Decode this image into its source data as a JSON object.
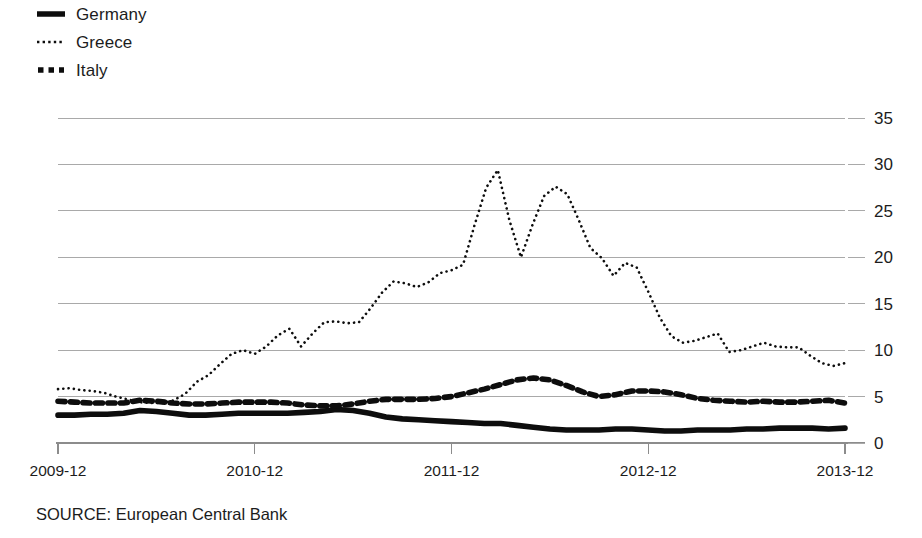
{
  "legend": {
    "position": "top-left",
    "entries": [
      {
        "label": "Germany",
        "style": "solid-thick",
        "icon": "solid-line-icon"
      },
      {
        "label": "Greece",
        "style": "fine-dotted",
        "icon": "dotted-line-icon"
      },
      {
        "label": "Italy",
        "style": "square-dashed",
        "icon": "dashed-line-icon"
      }
    ]
  },
  "footer": {
    "source": "SOURCE: European Central Bank"
  },
  "chart_data": {
    "type": "line",
    "title": "",
    "subtitle": "",
    "xlabel": "",
    "ylabel": "",
    "grid": true,
    "legend_position": "top-left",
    "y_axis_side": "right",
    "ylim": [
      0,
      35
    ],
    "yticks": [
      0,
      5,
      10,
      15,
      20,
      25,
      30,
      35
    ],
    "ytick_labels": [
      "0",
      "5",
      "10",
      "15",
      "20",
      "25",
      "30",
      "35"
    ],
    "xtick_labels": [
      "2009-12",
      "2010-12",
      "2011-12",
      "2012-12",
      "2013-12"
    ],
    "xtick_index": [
      0,
      12,
      24,
      36,
      48
    ],
    "x": [
      "2009-12",
      "2010-01",
      "2010-02",
      "2010-03",
      "2010-04",
      "2010-05",
      "2010-06",
      "2010-07",
      "2010-08",
      "2010-09",
      "2010-10",
      "2010-11",
      "2010-12",
      "2011-01",
      "2011-02",
      "2011-03",
      "2011-04",
      "2011-05",
      "2011-06",
      "2011-07",
      "2011-08",
      "2011-09",
      "2011-10",
      "2011-11",
      "2011-12",
      "2012-01",
      "2012-02",
      "2012-03",
      "2012-04",
      "2012-05",
      "2012-06",
      "2012-07",
      "2012-08",
      "2012-09",
      "2012-10",
      "2012-11",
      "2012-12",
      "2013-01",
      "2013-02",
      "2013-03",
      "2013-04",
      "2013-05",
      "2013-06",
      "2013-07",
      "2013-08",
      "2013-09",
      "2013-10",
      "2013-11",
      "2013-12"
    ],
    "series": [
      {
        "name": "Germany",
        "style": "solid-thick",
        "values": [
          3.0,
          3.0,
          3.1,
          3.1,
          3.2,
          3.5,
          3.4,
          3.2,
          3.0,
          3.0,
          3.1,
          3.2,
          3.2,
          3.2,
          3.2,
          3.3,
          3.4,
          3.6,
          3.5,
          3.2,
          2.8,
          2.6,
          2.5,
          2.4,
          2.3,
          2.2,
          2.1,
          2.1,
          1.9,
          1.7,
          1.5,
          1.4,
          1.4,
          1.4,
          1.5,
          1.5,
          1.4,
          1.3,
          1.3,
          1.4,
          1.4,
          1.4,
          1.5,
          1.5,
          1.6,
          1.6,
          1.6,
          1.5,
          1.6
        ]
      },
      {
        "name": "Greece",
        "style": "fine-dotted",
        "values": [
          5.8,
          5.9,
          5.7,
          5.6,
          5.4,
          5.0,
          4.7,
          4.4,
          4.3,
          4.3,
          4.6,
          5.3,
          6.6,
          7.3,
          8.5,
          9.6,
          10.0,
          9.6,
          10.4,
          11.6,
          12.3,
          10.4,
          11.8,
          13.0,
          13.1,
          12.9,
          13.0,
          14.5,
          16.2,
          17.4,
          17.2,
          16.8,
          17.3,
          18.3,
          18.6,
          19.2,
          23.5,
          27.5,
          29.4,
          24.0,
          20.0,
          23.5,
          26.6,
          27.6,
          26.8,
          24.0,
          21.0,
          19.9,
          18.0
        ]
      },
      {
        "name": "Italy",
        "style": "square-dashed",
        "values": [
          4.5,
          4.4,
          4.3,
          4.3,
          4.3,
          4.6,
          4.5,
          4.3,
          4.2,
          4.2,
          4.3,
          4.4,
          4.4,
          4.4,
          4.3,
          4.1,
          4.0,
          4.0,
          4.2,
          4.5,
          4.7,
          4.7,
          4.7,
          4.8,
          5.0,
          5.4,
          5.8,
          6.3,
          6.8,
          7.0,
          6.8,
          6.2,
          5.5,
          5.0,
          5.2,
          5.6,
          5.6,
          5.5,
          5.2,
          4.8,
          4.6,
          4.5,
          4.4,
          4.5,
          4.4,
          4.4,
          4.5,
          4.6,
          4.3
        ]
      }
    ],
    "greece_tail": [
      19.4,
      18.9,
      16.3,
      13.5,
      11.5,
      10.8,
      11.0,
      11.4,
      11.8,
      9.8,
      10.0,
      10.4,
      10.8,
      10.4,
      10.3,
      10.3,
      9.4,
      8.6,
      8.3,
      8.6
    ]
  }
}
